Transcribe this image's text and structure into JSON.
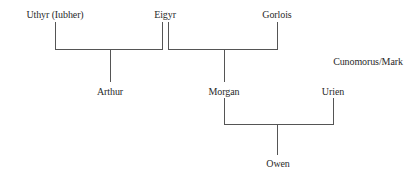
{
  "diagram": {
    "type": "family-tree",
    "line_color": "#555555",
    "nodes": {
      "uthyr": {
        "label": "Uthyr (Iubher)",
        "x": 55,
        "y": 9
      },
      "eigyr": {
        "label": "Eigyr",
        "x": 165,
        "y": 9
      },
      "gorlois": {
        "label": "Gorlois",
        "x": 277,
        "y": 9
      },
      "cunomorus": {
        "label": "Cunomorus/Mark",
        "x": 368,
        "y": 56
      },
      "arthur": {
        "label": "Arthur",
        "x": 110,
        "y": 86
      },
      "morgan": {
        "label": "Morgan",
        "x": 224,
        "y": 86
      },
      "urien": {
        "label": "Urien",
        "x": 333,
        "y": 86
      },
      "owen": {
        "label": "Owen",
        "x": 278,
        "y": 158
      }
    },
    "relations": [
      {
        "parents": [
          "Uthyr (Iubher)",
          "Eigyr"
        ],
        "child": "Arthur"
      },
      {
        "parents": [
          "Eigyr",
          "Gorlois"
        ],
        "child": "Morgan"
      },
      {
        "parents": [
          "Morgan",
          "Urien"
        ],
        "child": "Owen"
      }
    ]
  }
}
